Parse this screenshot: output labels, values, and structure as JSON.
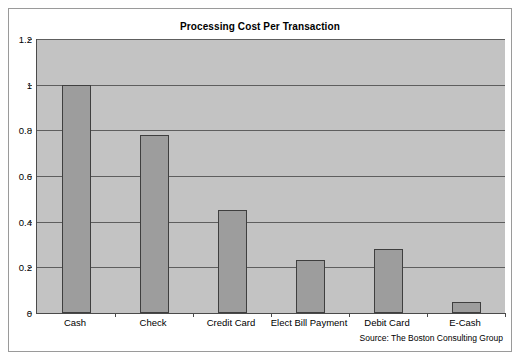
{
  "chart_data": {
    "type": "bar",
    "title": "Processing Cost Per Transaction",
    "xlabel": "",
    "ylabel": "",
    "categories": [
      "Cash",
      "Check",
      "Credit Card",
      "Elect Bill Payment",
      "Debit Card",
      "E-Cash"
    ],
    "values": [
      1.0,
      0.78,
      0.45,
      0.23,
      0.28,
      0.05
    ],
    "ylim": [
      0,
      1.2
    ],
    "ytick_labels": [
      "0",
      "0.2",
      "0.4",
      "0.6",
      "0.8",
      "1",
      "1.2"
    ],
    "ytick_values": [
      0,
      0.2,
      0.4,
      0.6,
      0.8,
      1.0,
      1.2
    ],
    "grid": true,
    "legend": false,
    "annotation": "Source: The Boston Consulting Group",
    "colors": {
      "bar_fill": "#9d9d9d",
      "bar_border": "#3f3f3f",
      "plot_background": "#c3c3c3",
      "gridline": "#5e5e5e",
      "axis": "#4a4a4a",
      "frame_border": "#9a9a9a",
      "text": "#000000"
    }
  }
}
